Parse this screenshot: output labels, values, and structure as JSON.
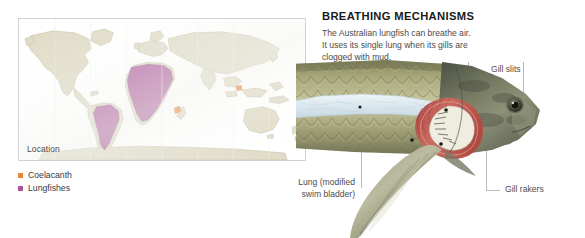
{
  "figure": {
    "map_panel": {
      "location_label": "Location",
      "land_color": "#ddd9c3",
      "land_outline": "#b9b5a0",
      "highlight_color": "#a9559a",
      "ocean_color": "#ffffff",
      "border_color": "#d2d2d2"
    },
    "legend": {
      "items": [
        {
          "label": "Coelacanth",
          "color": "#e2863c"
        },
        {
          "label": "Lungfishes",
          "color": "#a9559a"
        }
      ]
    },
    "breathing": {
      "title": "BREATHING MECHANISMS",
      "body": "The Australian lungfish can breathe air. It uses its single lung when its gills are clogged with mud."
    },
    "callouts": [
      {
        "id": "gill-filaments",
        "label": "Gill filaments"
      },
      {
        "id": "gill-slits",
        "label": "Gill slits"
      },
      {
        "id": "gill-rakers",
        "label": "Gill rakers"
      },
      {
        "id": "lung",
        "line1": "Lung (modified",
        "line2": "swim bladder)"
      }
    ],
    "fish": {
      "body_scale_color": "#9c9a6f",
      "body_scale_light": "#cfcdab",
      "head_color": "#6e7360",
      "lung_color": "#dfeaf0",
      "gill_filament_color": "#c3564f",
      "gill_raker_color": "#f2f0e6",
      "fin_color": "#8b8c74",
      "eye_color": "#2b2b26",
      "leader_line_color": "#b9b9b9"
    }
  }
}
